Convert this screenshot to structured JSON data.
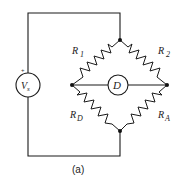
{
  "diagram": {
    "type": "Wheatstone bridge circuit",
    "source": {
      "label": "V",
      "subscript": "s",
      "polarity": "+"
    },
    "detector": {
      "label": "D"
    },
    "resistors": [
      {
        "id": "R1",
        "label": "R",
        "subscript": "1",
        "position": "upper-left"
      },
      {
        "id": "R2",
        "label": "R",
        "subscript": "2",
        "position": "upper-right"
      },
      {
        "id": "RD",
        "label": "R",
        "subscript": "D",
        "position": "lower-left"
      },
      {
        "id": "RA",
        "label": "R",
        "subscript": "A",
        "position": "lower-right"
      }
    ],
    "caption": "(a)"
  }
}
